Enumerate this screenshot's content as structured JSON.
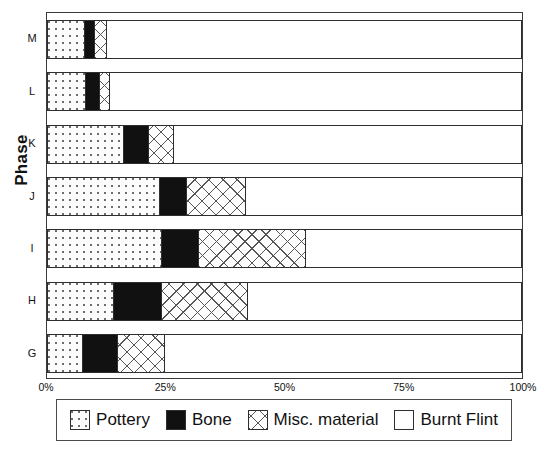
{
  "chart_data": {
    "type": "bar",
    "orientation": "horizontal",
    "stacked": true,
    "normalized": true,
    "title": "",
    "xlabel": "",
    "ylabel": "Phase",
    "xlim": [
      0,
      100
    ],
    "xticks": [
      "0%",
      "25%",
      "50%",
      "75%",
      "100%"
    ],
    "xtick_values": [
      0,
      25,
      50,
      75,
      100
    ],
    "grid": false,
    "legend_position": "bottom",
    "categories": [
      "M",
      "L",
      "K",
      "J",
      "I",
      "H",
      "G"
    ],
    "series": [
      {
        "name": "Pottery",
        "pattern": "dotted",
        "color": "#fcfcfc",
        "values": [
          7.8,
          8.0,
          16.1,
          23.7,
          24.1,
          14.0,
          7.3
        ]
      },
      {
        "name": "Bone",
        "pattern": "solid-black",
        "color": "#111111",
        "values": [
          2.1,
          2.9,
          5.3,
          5.7,
          7.8,
          10.1,
          7.4
        ]
      },
      {
        "name": "Misc. material",
        "pattern": "cross-hatch",
        "color": "#fdfdfd",
        "values": [
          2.5,
          2.3,
          5.2,
          12.5,
          22.6,
          18.2,
          10.0
        ]
      },
      {
        "name": "Burnt Flint",
        "pattern": "blank",
        "color": "#ffffff",
        "values": [
          87.6,
          86.8,
          73.4,
          58.1,
          45.5,
          57.7,
          75.3
        ]
      }
    ]
  },
  "axes": {
    "y_title": "Phase",
    "y_ticks": [
      "M",
      "L",
      "K",
      "J",
      "I",
      "H",
      "G"
    ],
    "x_ticks": [
      "0%",
      "25%",
      "50%",
      "75%",
      "100%"
    ]
  },
  "legend": {
    "entries": [
      {
        "label": "Pottery",
        "swatch": "pottery-swatch"
      },
      {
        "label": "Bone",
        "swatch": "bone-swatch"
      },
      {
        "label": "Misc. material",
        "swatch": "misc-material-swatch"
      },
      {
        "label": "Burnt Flint",
        "swatch": "burnt-flint-swatch"
      }
    ]
  }
}
